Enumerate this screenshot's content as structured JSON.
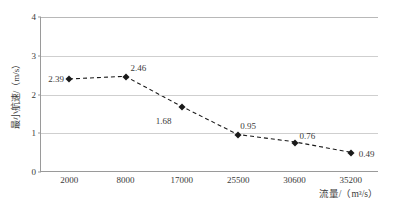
{
  "chart_data": {
    "type": "line",
    "title": "",
    "xlabel": "流量/（m³/s）",
    "ylabel": "最小航速/（m/s）",
    "categories": [
      "2000",
      "8000",
      "17000",
      "25500",
      "30600",
      "35200"
    ],
    "values": [
      2.39,
      2.46,
      1.68,
      0.95,
      0.76,
      0.49
    ],
    "point_labels": [
      "2.39",
      "2.46",
      "1.68",
      "0.95",
      "0.76",
      "0.49"
    ],
    "yticks": [
      "0",
      "1",
      "2",
      "3",
      "4"
    ],
    "ylim": [
      0,
      4
    ],
    "grid": "horizontal",
    "legend": "none",
    "line_style": "dashed",
    "marker": "diamond",
    "series_color": "#1a1a1a",
    "gridline_color": "#cfcfcf",
    "axis_color": "#9a9a9a",
    "background_color": "#ffffff"
  }
}
